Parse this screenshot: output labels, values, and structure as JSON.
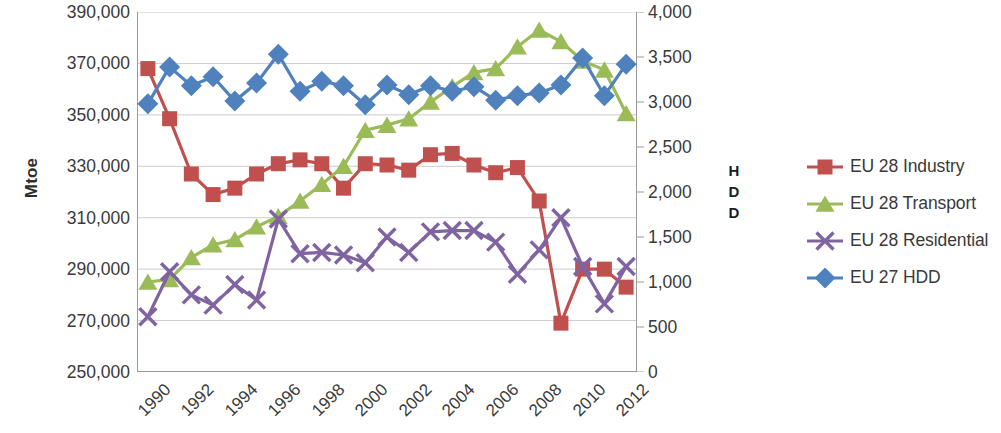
{
  "chart_data": {
    "type": "line",
    "title": "",
    "xlabel": "",
    "ylabel": "Mtoe",
    "y2label": "HDD",
    "grid": true,
    "legend_position": "right",
    "x": [
      1990,
      1991,
      1992,
      1993,
      1994,
      1995,
      1996,
      1997,
      1998,
      1999,
      2000,
      2001,
      2002,
      2003,
      2004,
      2005,
      2006,
      2007,
      2008,
      2009,
      2010,
      2011,
      2012
    ],
    "xtick_labels": [
      "1990",
      "1992",
      "1994",
      "1996",
      "1998",
      "2000",
      "2002",
      "2004",
      "2006",
      "2008",
      "2010",
      "2012"
    ],
    "ylim": [
      250000,
      390000
    ],
    "ytick_labels": [
      "250,000",
      "270,000",
      "290,000",
      "310,000",
      "330,000",
      "350,000",
      "370,000",
      "390,000"
    ],
    "ytick_values": [
      250000,
      270000,
      290000,
      310000,
      330000,
      350000,
      370000,
      390000
    ],
    "y2lim": [
      0,
      4000
    ],
    "y2tick_labels": [
      "0",
      "500",
      "1,000",
      "1,500",
      "2,000",
      "2,500",
      "3,000",
      "3,500",
      "4,000"
    ],
    "y2tick_values": [
      0,
      500,
      1000,
      1500,
      2000,
      2500,
      3000,
      3500,
      4000
    ],
    "series": [
      {
        "name": "EU 28 Industry",
        "axis": "left",
        "color": "#C0504D",
        "marker": "square",
        "values": [
          368000,
          348500,
          327000,
          319000,
          321500,
          327000,
          331000,
          332500,
          331000,
          321500,
          331000,
          330500,
          328500,
          334500,
          335000,
          330500,
          327500,
          329500,
          316500,
          269000,
          290000,
          290000,
          283000
        ]
      },
      {
        "name": "EU 28 Transport",
        "axis": "left",
        "color": "#9BBB59",
        "marker": "triangle",
        "values": [
          285000,
          286000,
          294500,
          299500,
          301500,
          306500,
          310500,
          316500,
          323000,
          330000,
          344000,
          346000,
          348500,
          355000,
          361000,
          366500,
          368000,
          376500,
          383000,
          378500,
          371000,
          367500,
          350500
        ]
      },
      {
        "name": "EU 28 Residential",
        "axis": "left",
        "color": "#8064A2",
        "marker": "x",
        "values": [
          271500,
          289000,
          280000,
          276000,
          284000,
          278000,
          309500,
          296000,
          296500,
          295500,
          292500,
          302500,
          296500,
          304500,
          305000,
          305000,
          300500,
          288000,
          297500,
          310000,
          291000,
          276500,
          291000
        ]
      },
      {
        "name": "EU 27 HDD",
        "axis": "right",
        "color": "#4F81BD",
        "marker": "diamond",
        "values": [
          2980,
          3390,
          3180,
          3280,
          3010,
          3210,
          3530,
          3120,
          3230,
          3180,
          2970,
          3190,
          3080,
          3180,
          3120,
          3170,
          3020,
          3070,
          3100,
          3190,
          3490,
          3070,
          3420
        ]
      }
    ]
  },
  "axes": {
    "left_title": "Mtoe",
    "right_title_lines": [
      "H",
      "D",
      "D"
    ]
  },
  "legend": {
    "items": [
      {
        "label": "EU 28 Industry",
        "color": "#C0504D",
        "marker": "square"
      },
      {
        "label": "EU 28 Transport",
        "color": "#9BBB59",
        "marker": "triangle"
      },
      {
        "label": "EU 28 Residential",
        "color": "#8064A2",
        "marker": "x"
      },
      {
        "label": "EU 27 HDD",
        "color": "#4F81BD",
        "marker": "diamond"
      }
    ]
  }
}
